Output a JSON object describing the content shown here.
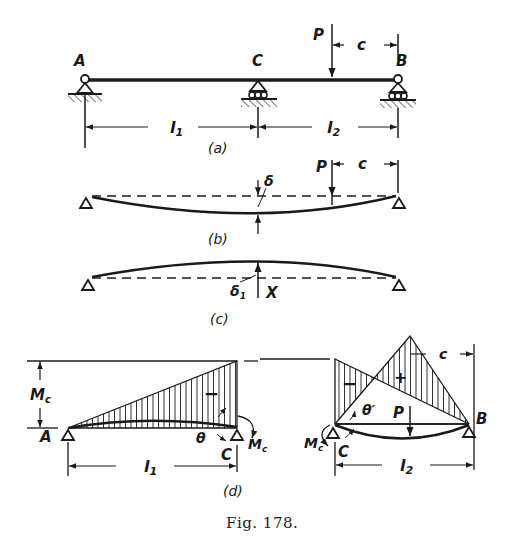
{
  "figure": {
    "caption": "Fig. 178.",
    "colors": {
      "ink": "#1a1a1a",
      "background": "#ffffff"
    },
    "panel_a": {
      "label": "(a)",
      "points": {
        "A": "A",
        "C": "C",
        "B": "B"
      },
      "load": "P",
      "load_offset": "c",
      "span_left": "l",
      "span_left_sub": "1",
      "span_right": "l",
      "span_right_sub": "2"
    },
    "panel_b": {
      "label": "(b)",
      "load": "P",
      "load_offset": "c",
      "deflection": "δ"
    },
    "panel_c": {
      "label": "(c)",
      "deflection": "δ",
      "deflection_sub": "1",
      "reaction": "X"
    },
    "panel_d": {
      "label": "(d)",
      "moment_height": "M",
      "moment_height_sub": "c",
      "left": {
        "start": "A",
        "end": "C",
        "sign": "−",
        "angle": "θ",
        "moment": "M",
        "moment_sub": "c",
        "span": "l",
        "span_sub": "1"
      },
      "right": {
        "start": "C",
        "end": "B",
        "sign_neg": "−",
        "sign_pos": "+",
        "angle": "θ′",
        "load": "P",
        "moment": "M",
        "moment_sub": "c",
        "offset": "c",
        "span": "l",
        "span_sub": "2"
      }
    }
  }
}
